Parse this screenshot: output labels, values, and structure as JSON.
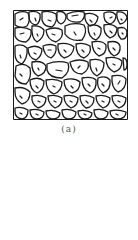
{
  "figure": {
    "caption": "(a)",
    "stroke_color": "#1a1a1a",
    "background": "#ffffff"
  }
}
